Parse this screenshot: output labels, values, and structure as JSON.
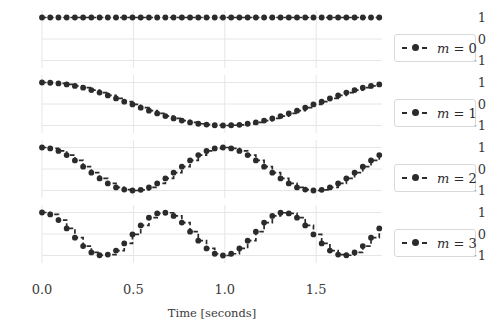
{
  "figure": {
    "background_color": "#ffffff",
    "grid_color": "#e6e6e6",
    "line_color": "#2b2b2b",
    "text_color": "#3a3a3a",
    "width": 486,
    "height": 329
  },
  "axis": {
    "xlabel": "Time [seconds]",
    "xticks": [
      "0.0",
      "0.5",
      "1.0",
      "1.5"
    ],
    "xtick_values": [
      0.0,
      0.5,
      1.0,
      1.5
    ],
    "yticks": [
      "1",
      "0",
      "−1"
    ],
    "ytick_values": [
      1,
      0,
      -1
    ]
  },
  "legend": {
    "position": "right",
    "entries": [
      {
        "label": "m = 0",
        "symbol": "m",
        "equals": "=",
        "value": "0"
      },
      {
        "label": "m = 1",
        "symbol": "m",
        "equals": "=",
        "value": "1"
      },
      {
        "label": "m = 2",
        "symbol": "m",
        "equals": "=",
        "value": "2"
      },
      {
        "label": "m = 3",
        "symbol": "m",
        "equals": "=",
        "value": "3"
      }
    ]
  },
  "chart_data": {
    "type": "line",
    "title": "",
    "subtitle": "",
    "xlabel": "Time [seconds]",
    "ylabel": "",
    "xlim": [
      0.0,
      1.86
    ],
    "ylim": [
      -1.35,
      1.35
    ],
    "grid": true,
    "legend_position": "right",
    "drawstyle": "steps-post",
    "marker": "o",
    "linestyle": "dashed",
    "subplots": 4,
    "shared_x": true,
    "x": [
      0.0,
      0.045,
      0.09,
      0.135,
      0.18,
      0.225,
      0.27,
      0.315,
      0.36,
      0.405,
      0.45,
      0.495,
      0.54,
      0.585,
      0.63,
      0.675,
      0.72,
      0.765,
      0.81,
      0.855,
      0.9,
      0.945,
      0.99,
      1.035,
      1.08,
      1.125,
      1.17,
      1.215,
      1.26,
      1.305,
      1.35,
      1.395,
      1.44,
      1.485,
      1.53,
      1.575,
      1.62,
      1.665,
      1.71,
      1.755,
      1.8,
      1.845
    ],
    "series": [
      {
        "name": "m = 0",
        "subplot": 0,
        "formula": "cos(0 * pi * t)",
        "values": [
          1,
          1,
          1,
          1,
          1,
          1,
          1,
          1,
          1,
          1,
          1,
          1,
          1,
          1,
          1,
          1,
          1,
          1,
          1,
          1,
          1,
          1,
          1,
          1,
          1,
          1,
          1,
          1,
          1,
          1,
          1,
          1,
          1,
          1,
          1,
          1,
          1,
          1,
          1,
          1,
          1,
          1
        ]
      },
      {
        "name": "m = 1",
        "subplot": 1,
        "formula": "cos(1 * pi * t)",
        "values": [
          1.0,
          0.99,
          0.96,
          0.91,
          0.84,
          0.76,
          0.65,
          0.53,
          0.4,
          0.26,
          0.11,
          -0.02,
          -0.17,
          -0.31,
          -0.44,
          -0.56,
          -0.67,
          -0.77,
          -0.86,
          -0.92,
          -0.96,
          -0.99,
          -1.0,
          -0.99,
          -0.97,
          -0.92,
          -0.86,
          -0.77,
          -0.67,
          -0.56,
          -0.44,
          -0.31,
          -0.17,
          -0.02,
          0.11,
          0.26,
          0.4,
          0.53,
          0.65,
          0.76,
          0.84,
          0.91
        ]
      },
      {
        "name": "m = 2",
        "subplot": 2,
        "formula": "cos(2 * pi * t)",
        "values": [
          1.0,
          0.96,
          0.84,
          0.65,
          0.4,
          0.11,
          -0.17,
          -0.44,
          -0.67,
          -0.86,
          -0.96,
          -1.0,
          -0.97,
          -0.86,
          -0.67,
          -0.44,
          -0.17,
          0.11,
          0.4,
          0.65,
          0.84,
          0.96,
          1.0,
          0.96,
          0.84,
          0.65,
          0.4,
          0.11,
          -0.17,
          -0.44,
          -0.67,
          -0.86,
          -0.96,
          -1.0,
          -0.97,
          -0.86,
          -0.67,
          -0.44,
          -0.17,
          0.11,
          0.4,
          0.65
        ]
      },
      {
        "name": "m = 3",
        "subplot": 3,
        "formula": "cos(3 * pi * t)",
        "values": [
          1.0,
          0.91,
          0.65,
          0.26,
          -0.17,
          -0.56,
          -0.86,
          -0.99,
          -0.96,
          -0.77,
          -0.44,
          -0.02,
          0.4,
          0.76,
          0.96,
          0.99,
          0.84,
          0.53,
          0.11,
          -0.31,
          -0.67,
          -0.92,
          -1.0,
          -0.92,
          -0.67,
          -0.31,
          0.11,
          0.53,
          0.84,
          0.99,
          0.96,
          0.76,
          0.4,
          -0.02,
          -0.44,
          -0.77,
          -0.96,
          -0.99,
          -0.86,
          -0.56,
          -0.17,
          0.26
        ]
      }
    ]
  }
}
